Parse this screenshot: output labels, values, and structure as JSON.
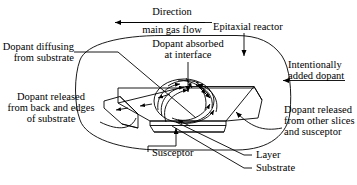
{
  "figure": {
    "background_color": "#ffffff",
    "line_color": "#000000"
  },
  "labels": {
    "direction": "Direction",
    "main_gas_flow": "main gas flow",
    "epitaxial_reactor": "Epitaxial reactor",
    "dopant_absorbed_1": "Dopant absorbed",
    "dopant_absorbed_2": "at interface",
    "dopant_diffusing_1": "Dopant diffusing",
    "dopant_diffusing_2": "from substrate",
    "intentionally_added_1": "Intentionally",
    "intentionally_added_2": "added dopant",
    "dopant_released_back_1": "Dopant released",
    "dopant_released_back_2": "from back and edges",
    "dopant_released_back_3": "of substrate",
    "dopant_released_other_1": "Dopant released",
    "dopant_released_other_2": "from other slices",
    "dopant_released_other_3": "and susceptor",
    "susceptor": "Susceptor",
    "layer": "Layer",
    "substrate": "Substrate"
  },
  "icons": {
    "gas_flow_arrow": "arrow-left-icon",
    "reactor_pointer": "arrow-down-icon",
    "dopant_inlet_arrow": "arrow-left-icon",
    "flow_arrows": "curved-flow-arrow-icon"
  }
}
